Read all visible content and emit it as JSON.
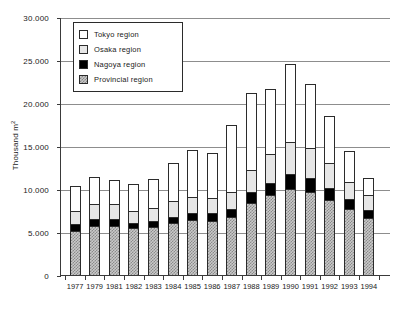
{
  "chart_data": {
    "type": "bar",
    "subtype": "stacked-vertical",
    "title": "",
    "xlabel": "",
    "ylabel": "Thousand m2",
    "ylabel_display": "Thousand m²",
    "ylim": [
      0,
      30000
    ],
    "yticks": [
      0,
      5000,
      10000,
      15000,
      20000,
      25000,
      30000
    ],
    "ytick_labels": [
      "0",
      "5.000",
      "10.000",
      "15.000",
      "20.000",
      "25.000",
      "30.000"
    ],
    "grid": true,
    "grid_axis": "y",
    "legend_position": "upper-left-inside",
    "categories": [
      "1977",
      "1979",
      "1981",
      "1982",
      "1983",
      "1984",
      "1985",
      "1986",
      "1987",
      "1988",
      "1989",
      "1990",
      "1991",
      "1992",
      "1993",
      "1994"
    ],
    "series": [
      {
        "name": "Provincial region",
        "color": "#c9c9c9",
        "pattern": "checker",
        "values": [
          5100,
          5700,
          5650,
          5500,
          5600,
          6000,
          6350,
          6300,
          6700,
          8400,
          9300,
          10000,
          9700,
          8750,
          7700,
          6600
        ]
      },
      {
        "name": "Nagoya region",
        "color": "#000000",
        "pattern": "solid",
        "values": [
          800,
          800,
          900,
          550,
          700,
          800,
          900,
          900,
          1000,
          1200,
          1400,
          1700,
          1600,
          1350,
          1100,
          950
        ]
      },
      {
        "name": "Osaka region",
        "color": "#e6e6e6",
        "pattern": "dots",
        "values": [
          1600,
          1750,
          1700,
          1450,
          1500,
          1750,
          1850,
          1800,
          2000,
          2600,
          3400,
          3800,
          3500,
          2950,
          2050,
          1700
        ]
      },
      {
        "name": "Tokyo region",
        "color": "#ffffff",
        "pattern": "plain",
        "values": [
          2900,
          3200,
          2850,
          3100,
          3400,
          4450,
          5400,
          5200,
          7800,
          9000,
          7500,
          9000,
          7400,
          5450,
          3550,
          2050
        ]
      }
    ],
    "totals": [
      10400,
      11450,
      11100,
      10600,
      11200,
      13000,
      14500,
      14200,
      17500,
      21200,
      21600,
      24500,
      22200,
      18500,
      14400,
      11300
    ]
  },
  "legend": {
    "items": [
      {
        "label": "Tokyo region",
        "swatch": "legend-swatch-tokyo"
      },
      {
        "label": "Osaka region",
        "swatch": "legend-swatch-osaka"
      },
      {
        "label": "Nagoya region",
        "swatch": "legend-swatch-nagoya"
      },
      {
        "label": "Provincial region",
        "swatch": "legend-swatch-provincial"
      }
    ]
  },
  "axes": {
    "y_title_main": "Thousand m",
    "y_title_sup": "2"
  }
}
